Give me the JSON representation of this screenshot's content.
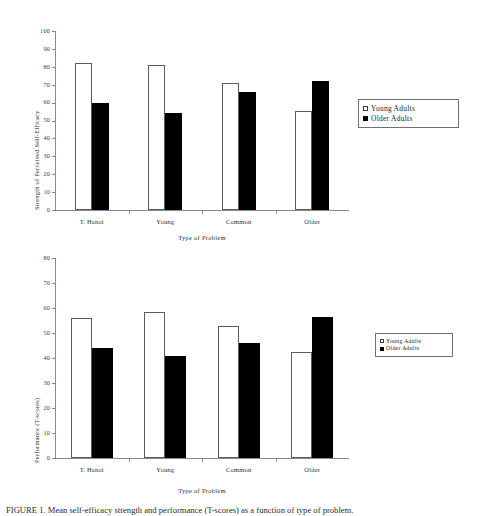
{
  "figure": {
    "caption": "FIGURE 1. Mean self-efficacy strength and performance (T-scores) as a function of type of problem."
  },
  "legend": {
    "items": [
      {
        "label": "Young Adults",
        "swatch": "open-square",
        "color": "#ffffff"
      },
      {
        "label": "Older Adults",
        "swatch": "filled-square",
        "color": "#000000"
      }
    ]
  },
  "chart_data": [
    {
      "type": "bar",
      "id": "self-efficacy",
      "title": "",
      "xlabel": "Type of Problem",
      "ylabel": "Strength of Perceived Self-Efficacy",
      "categories": [
        "T. Hanoi",
        "Young",
        "Common",
        "Older"
      ],
      "series": [
        {
          "name": "Young Adults",
          "values": [
            82,
            81,
            71,
            55.5
          ],
          "color": "#ffffff"
        },
        {
          "name": "Older Adults",
          "values": [
            60,
            54,
            66,
            72
          ],
          "color": "#000000"
        }
      ],
      "ylim": [
        0,
        100
      ],
      "yticks": [
        0,
        10,
        20,
        30,
        40,
        50,
        60,
        70,
        80,
        90,
        100
      ],
      "grid": false,
      "legend_position": "right"
    },
    {
      "type": "bar",
      "id": "performance",
      "title": "",
      "xlabel": "Type of Problem",
      "ylabel": "Performance (T-scores)",
      "categories": [
        "T. Hanoi",
        "Young",
        "Common",
        "Older"
      ],
      "series": [
        {
          "name": "Young Adults",
          "values": [
            56,
            58.5,
            53,
            42.5
          ],
          "color": "#ffffff"
        },
        {
          "name": "Older Adults",
          "values": [
            44,
            41,
            46,
            56.5
          ],
          "color": "#000000"
        }
      ],
      "ylim": [
        0,
        80
      ],
      "yticks": [
        0,
        10,
        20,
        30,
        40,
        50,
        60,
        70,
        80
      ],
      "grid": false,
      "legend_position": "right"
    }
  ]
}
